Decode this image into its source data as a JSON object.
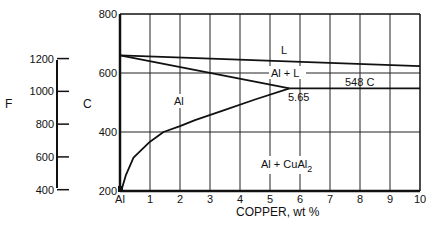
{
  "chart_data": {
    "type": "line",
    "title": "",
    "xlabel": "COPPER, wt %",
    "ylabel_left": "F",
    "ylabel_right": "C",
    "x_ticks": [
      "Al",
      "1",
      "2",
      "3",
      "4",
      "5",
      "6",
      "7",
      "8",
      "9",
      "10"
    ],
    "xlim": [
      0,
      10
    ],
    "ylim_celsius": [
      200,
      800
    ],
    "y_ticks_celsius": [
      "200",
      "400",
      "600",
      "800"
    ],
    "y_ticks_fahrenheit": [
      "400",
      "600",
      "800",
      "1000",
      "1200"
    ],
    "grid": true,
    "series": [
      {
        "name": "liquidus-upper",
        "x": [
          0,
          10
        ],
        "y": [
          660,
          623
        ]
      },
      {
        "name": "liquidus",
        "x": [
          0,
          5.65
        ],
        "y": [
          660,
          548
        ]
      },
      {
        "name": "eutectic",
        "x": [
          5.65,
          10
        ],
        "y": [
          548,
          548
        ]
      },
      {
        "name": "solvus",
        "x": [
          0.05,
          0.2,
          0.45,
          1.0,
          1.45,
          2.0,
          2.5,
          3.5,
          4.5,
          5.65
        ],
        "y": [
          203,
          255,
          313,
          367,
          400,
          420,
          440,
          475,
          510,
          548
        ]
      }
    ],
    "annotations": [
      {
        "text": "L",
        "x": 5.5,
        "y": 723
      },
      {
        "text": "Al + L",
        "x": 5.2,
        "y": 600
      },
      {
        "text": "548 C",
        "x": 8.1,
        "y": 570
      },
      {
        "text": "5.65",
        "x": 6.0,
        "y": 520
      },
      {
        "text": "Al",
        "x": 2.0,
        "y": 505
      },
      {
        "text": "Al + CuAl2",
        "x": 6.0,
        "y": 280
      }
    ]
  },
  "labels": {
    "f_axis": "F",
    "c_axis": "C",
    "x_axis": "COPPER, wt %",
    "region_L": "L",
    "region_al_l": "Al + L",
    "eutectic_temp": "548 C",
    "eutectic_comp": "5.65",
    "region_al": "Al",
    "region_al_cual2_main": "Al + CuAl",
    "region_al_cual2_sub": "2"
  }
}
